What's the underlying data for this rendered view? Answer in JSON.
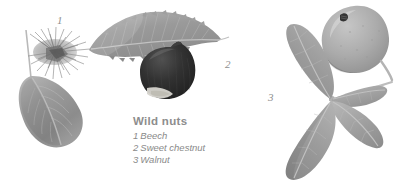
{
  "plate": {
    "background_color": "#ffffff",
    "width": 399,
    "height": 191,
    "style": "grayscale botanical photographic plate"
  },
  "caption": {
    "title": "Wild nuts",
    "title_color": "#8d8d8d",
    "entries": [
      {
        "number": "1",
        "label": "Beech"
      },
      {
        "number": "2",
        "label": "Sweet chestnut"
      },
      {
        "number": "3",
        "label": "Walnut"
      }
    ]
  },
  "figure_labels": [
    {
      "id": "1",
      "text": "1",
      "refers_to": "Beech"
    },
    {
      "id": "2",
      "text": "2",
      "refers_to": "Sweet chestnut"
    },
    {
      "id": "3",
      "text": "3",
      "refers_to": "Walnut"
    }
  ],
  "specimens": [
    {
      "number": "1",
      "name": "beech",
      "parts": [
        "spiky bristled husk",
        "elliptical leaf with midrib"
      ],
      "leaf_color": "#979797",
      "husk_color": "#aeaeae"
    },
    {
      "number": "2",
      "name": "sweet-chestnut",
      "parts": [
        "long serrated lanceolate leaf",
        "dark glossy nut with pale basal scar"
      ],
      "leaf_color": "#9c9c9c",
      "nut_color": "#2d2d2d",
      "scar_color": "#d8d6cf"
    },
    {
      "number": "3",
      "name": "walnut",
      "parts": [
        "round fruit with dark blemish",
        "compound leaf with four leaflets"
      ],
      "leaf_color": "#a0a0a0",
      "fruit_color": "#adadad",
      "blemish_color": "#3a3a3a"
    }
  ]
}
